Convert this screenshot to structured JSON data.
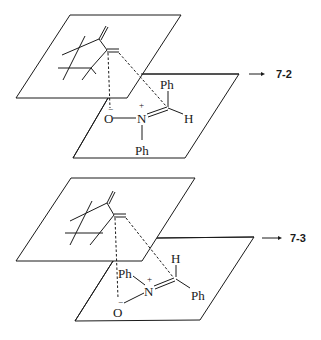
{
  "figure": {
    "panels": [
      {
        "id": "top",
        "product_label": "7-2",
        "atoms": {
          "phenyl_top": "Ph",
          "hydrogen": "H",
          "nitrogen": "N",
          "nitrogen_charge": "+",
          "oxygen": "O",
          "oxygen_charge": "−",
          "phenyl_bottom": "Ph"
        }
      },
      {
        "id": "bottom",
        "product_label": "7-3",
        "atoms": {
          "hydrogen": "H",
          "phenyl_right": "Ph",
          "nitrogen": "N",
          "nitrogen_charge": "+",
          "phenyl_left": "Ph",
          "oxygen": "O",
          "oxygen_charge": "−"
        }
      }
    ],
    "colors": {
      "ink": "#1a1a1a",
      "background": "#ffffff"
    }
  }
}
